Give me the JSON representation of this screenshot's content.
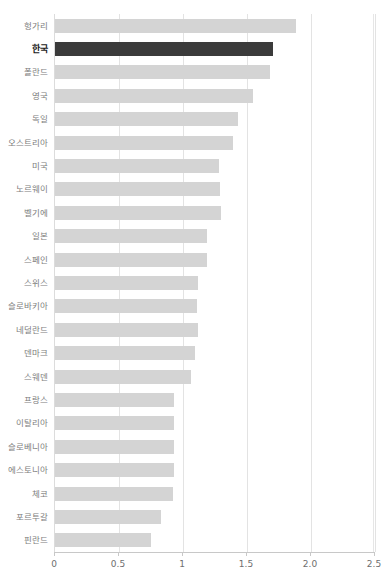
{
  "chart_data": {
    "type": "bar",
    "orientation": "horizontal",
    "title": "",
    "xlabel": "",
    "ylabel": "",
    "xlim": [
      0,
      2.5
    ],
    "grid": true,
    "legend": null,
    "xticks": [
      "0",
      "0.5",
      "1",
      "1.5",
      "2.0",
      "2.5"
    ],
    "xtick_values": [
      0,
      0.5,
      1,
      1.5,
      2.0,
      2.5
    ],
    "highlight_category": "한국",
    "colors": {
      "bar": "#d4d4d4",
      "bar_highlight": "#3b3b3b",
      "gridline": "#e3e3e3",
      "axis": "#c8c8c8",
      "label": "#7d7d7d",
      "label_highlight": "#1a1a1a",
      "background": "#ffffff"
    },
    "categories": [
      "헝가리",
      "한국",
      "폴란드",
      "영국",
      "독일",
      "오스트리아",
      "미국",
      "노르웨이",
      "벨기에",
      "일본",
      "스페인",
      "스위스",
      "슬로바키아",
      "네덜란드",
      "덴마크",
      "스웨덴",
      "프랑스",
      "이탈리아",
      "슬로베니아",
      "에스토니아",
      "체코",
      "포르투갈",
      "핀란드"
    ],
    "values": [
      1.88,
      1.7,
      1.68,
      1.55,
      1.43,
      1.39,
      1.28,
      1.29,
      1.3,
      1.19,
      1.19,
      1.12,
      1.11,
      1.12,
      1.09,
      1.06,
      0.93,
      0.93,
      0.93,
      0.93,
      0.92,
      0.83,
      0.75
    ]
  }
}
